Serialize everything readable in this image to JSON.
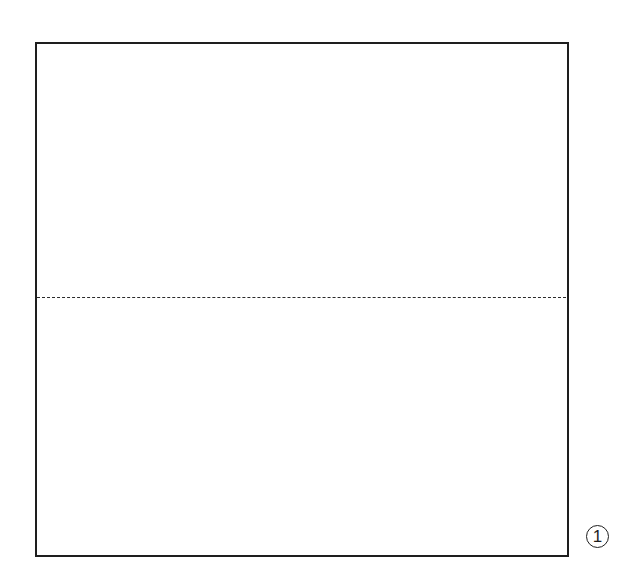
{
  "diagram": {
    "type": "origami-step",
    "shape": "square",
    "fold_lines": [
      {
        "orientation": "horizontal",
        "style": "dashed",
        "position": "middle"
      }
    ],
    "step": {
      "number": "1"
    },
    "colors": {
      "line": "#1e1e1e",
      "background": "#ffffff"
    }
  }
}
